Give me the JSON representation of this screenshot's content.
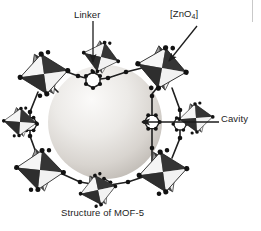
{
  "figure": {
    "caption": "Structure of MOF-5",
    "title": "Structure of MOF-5",
    "background_color": "#ffffff",
    "annotations": [
      {
        "id": "linker",
        "label": "Linker",
        "label_x": 74,
        "label_y": 9,
        "arrow": {
          "type": "straight-vertical",
          "from_x": 93,
          "from_y": 21,
          "to_x": 93,
          "to_y": 62,
          "direction": "down",
          "color": "#1c1c1c"
        },
        "points_to": "benzene-dicarboxylate-linker"
      },
      {
        "id": "zno4",
        "label": "[ZnO4]",
        "label_text": "[ZnO",
        "label_sub": "4",
        "label_tail": "]",
        "label_x": 170,
        "label_y": 8,
        "arrow": {
          "type": "straight-diagonal",
          "from_x": 196,
          "from_y": 27,
          "to_x": 168,
          "to_y": 62,
          "direction": "down-left",
          "color": "#1c1c1c"
        },
        "points_to": "zinc-oxide-tetrahedra-cluster"
      },
      {
        "id": "cavity",
        "label": "Cavity",
        "label_x": 221,
        "label_y": 113,
        "arrow": {
          "type": "straight-horizontal",
          "from_x": 218,
          "from_y": 122,
          "to_x": 142,
          "to_y": 122,
          "direction": "left",
          "color": "#1c1c1c"
        },
        "points_to": "central-cavity-sphere"
      }
    ],
    "structure": {
      "name": "MOF-5",
      "cavity_sphere": {
        "center_x": 105,
        "center_y": 122,
        "radius": 57,
        "fill_light": "#f2f0ee",
        "fill_mid": "#dedbd7",
        "fill_dark": "#bab6b1"
      },
      "cluster_count": 8,
      "cluster_label": "[ZnO4] tetrahedra",
      "cluster_colors": {
        "dark_facet": "#3c3c3c",
        "mid_facet": "#8a8a8a",
        "light_facet": "#f4f4f4",
        "shadow_facet": "#5e5e5e"
      },
      "linker_label": "benzene ring linker",
      "linker_colors": {
        "bond": "#2a2a2a",
        "atom": "#161616"
      },
      "clusters": [
        {
          "x": 44,
          "y": 72,
          "scale": 1.0
        },
        {
          "x": 160,
          "y": 68,
          "scale": 1.02
        },
        {
          "x": 40,
          "y": 170,
          "scale": 0.98
        },
        {
          "x": 163,
          "y": 172,
          "scale": 1.0
        },
        {
          "x": 100,
          "y": 57,
          "scale": 0.8
        },
        {
          "x": 96,
          "y": 188,
          "scale": 0.8
        },
        {
          "x": 196,
          "y": 118,
          "scale": 0.74
        },
        {
          "x": 22,
          "y": 120,
          "scale": 0.72
        }
      ]
    }
  }
}
